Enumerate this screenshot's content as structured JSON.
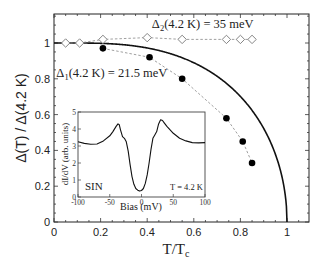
{
  "chart_data": {
    "type": "scatter",
    "title": "",
    "xlabel": "T/T",
    "xlabel_subscript": "c",
    "ylabel": "Δ(T) / Δ(4.2 K)",
    "xlim": [
      0,
      1.1
    ],
    "ylim": [
      0,
      1.15
    ],
    "xticks": [
      0,
      0.2,
      0.4,
      0.6,
      0.8,
      1
    ],
    "xtick_labels": [
      "0",
      "0.2",
      "0.4",
      "0.6",
      "0.8",
      "1"
    ],
    "yticks": [
      0,
      0.2,
      0.4,
      0.6,
      0.8,
      1
    ],
    "ytick_labels": [
      "0",
      "0.2",
      "0.4",
      "0.6",
      "0.8",
      "1"
    ],
    "grid": false,
    "series": [
      {
        "name": "Δ2(4.2 K) = 35 meV",
        "marker": "open-diamond",
        "line": "dashed",
        "x": [
          0.05,
          0.11,
          0.21,
          0.4,
          0.55,
          0.74,
          0.8,
          0.85
        ],
        "y": [
          1.0,
          1.0,
          1.02,
          1.03,
          1.02,
          1.02,
          1.02,
          1.02
        ]
      },
      {
        "name": "Δ1(4.2 K) = 21.5 meV",
        "marker": "filled-circle",
        "line": "dashed",
        "x": [
          0.21,
          0.41,
          0.55,
          0.74,
          0.81,
          0.85
        ],
        "y": [
          0.97,
          0.92,
          0.8,
          0.58,
          0.45,
          0.33
        ]
      },
      {
        "name": "BCS",
        "marker": "none",
        "line": "solid",
        "function": "bcs_gap",
        "x_range": [
          0,
          1
        ]
      }
    ],
    "annotations": [
      {
        "text_main": "Δ",
        "text_sub": "2",
        "text_rest": "(4.2 K) = 35 meV",
        "x": 0.42,
        "y": 1.085
      },
      {
        "text_main": "Δ",
        "text_sub": "1",
        "text_rest": "(4.2 K) = 21.5 meV",
        "x": 0.01,
        "y": 0.81
      }
    ],
    "inset": {
      "type": "line",
      "xlabel": "Bias (mV)",
      "ylabel": "dI/dV (arb. units)",
      "xlim": [
        -100,
        100
      ],
      "ylim": [
        0,
        5
      ],
      "xticks": [
        -100,
        -50,
        0,
        50,
        100
      ],
      "xtick_labels": [
        "-100",
        "-50",
        "0",
        "50",
        "100"
      ],
      "yticks": [
        0,
        1,
        2,
        3,
        4,
        5
      ],
      "ytick_labels": [
        "0",
        "1",
        "2",
        "3",
        "4",
        "5"
      ],
      "label_left": "SIN",
      "label_right": "T = 4.2 K",
      "x": [
        -100,
        -90,
        -80,
        -70,
        -60,
        -50,
        -45,
        -40,
        -37,
        -35,
        -33,
        -30,
        -27,
        -24,
        -21,
        -18,
        -15,
        -12,
        -9,
        -6,
        -3,
        0,
        3,
        6,
        9,
        12,
        15,
        18,
        21,
        24,
        27,
        30,
        33,
        36,
        40,
        45,
        50,
        60,
        70,
        80,
        90,
        100
      ],
      "y": [
        3.25,
        3.15,
        3.1,
        3.12,
        3.3,
        3.6,
        3.85,
        4.15,
        4.3,
        4.25,
        3.95,
        3.55,
        3.45,
        3.25,
        2.7,
        1.9,
        1.2,
        0.75,
        0.5,
        0.4,
        0.35,
        0.38,
        0.5,
        0.8,
        1.3,
        2.0,
        2.8,
        3.45,
        3.65,
        3.85,
        4.3,
        4.55,
        4.5,
        4.35,
        4.15,
        3.95,
        3.75,
        3.45,
        3.3,
        3.2,
        3.18,
        3.2
      ]
    }
  }
}
